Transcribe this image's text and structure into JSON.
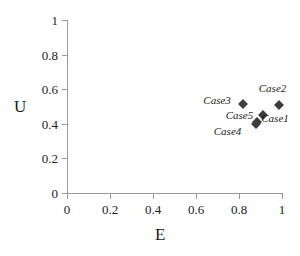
{
  "chart_data": {
    "type": "scatter",
    "title": "",
    "xlabel": "E",
    "ylabel": "U",
    "xlim": [
      0,
      1
    ],
    "ylim": [
      0,
      1
    ],
    "grid": false,
    "legend": "none",
    "xticks": [
      "0",
      "0.2",
      "0.4",
      "0.6",
      "0.8",
      "1"
    ],
    "xtick_values": [
      0,
      0.2,
      0.4,
      0.6,
      0.8,
      1
    ],
    "yticks": [
      "0",
      "0.2",
      "0.4",
      "0.6",
      "0.8",
      "1"
    ],
    "ytick_values": [
      0,
      0.2,
      0.4,
      0.6,
      0.8,
      1
    ],
    "marker": "diamond",
    "marker_color": "#3d3d3d",
    "points": [
      {
        "label": "Case1",
        "x": 0.885,
        "y": 0.41,
        "label_dx": 4,
        "label_dy": -4
      },
      {
        "label": "Case2",
        "x": 0.985,
        "y": 0.51,
        "label_dx": -20,
        "label_dy": -17
      },
      {
        "label": "Case3",
        "x": 0.82,
        "y": 0.515,
        "label_dx": -40,
        "label_dy": -4
      },
      {
        "label": "Case4",
        "x": 0.878,
        "y": 0.4,
        "label_dx": -42,
        "label_dy": 7
      },
      {
        "label": "Case5",
        "x": 0.91,
        "y": 0.45,
        "label_dx": -37,
        "label_dy": 0
      }
    ]
  },
  "axes": {
    "x_title": "E",
    "y_title": "U"
  }
}
